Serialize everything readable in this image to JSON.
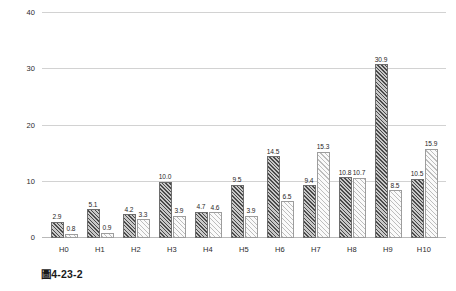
{
  "chart_data": {
    "type": "bar",
    "title": "",
    "xlabel": "",
    "ylabel": "",
    "ylim": [
      0,
      40
    ],
    "yticks": [
      0,
      10,
      20,
      30,
      40
    ],
    "ytick_labels": [
      "0",
      "10",
      "20",
      "30",
      "40"
    ],
    "grid": true,
    "legend": "none",
    "categories": [
      "H0",
      "H1",
      "H2",
      "H3",
      "H4",
      "H5",
      "H6",
      "H7",
      "H8",
      "H9",
      "H10"
    ],
    "series": [
      {
        "name": "series-a",
        "style": "dark-hatched",
        "values": [
          2.9,
          5.1,
          4.2,
          10.0,
          4.7,
          9.5,
          14.5,
          9.4,
          10.8,
          30.9,
          10.5
        ],
        "labels": [
          "2.9",
          "5.1",
          "4.2",
          "10.0",
          "4.7",
          "9.5",
          "14.5",
          "9.4",
          "10.8",
          "30.9",
          "10.5"
        ]
      },
      {
        "name": "series-b",
        "style": "light-hatched",
        "values": [
          0.8,
          0.9,
          3.3,
          3.9,
          4.6,
          3.9,
          6.5,
          15.3,
          10.7,
          8.5,
          15.9
        ],
        "labels": [
          "0.8",
          "0.9",
          "3.3",
          "3.9",
          "4.6",
          "3.9",
          "6.5",
          "15.3",
          "10.7",
          "8.5",
          "15.9"
        ]
      }
    ]
  },
  "caption": {
    "text": "圖4-23-2"
  },
  "colors": {
    "gridline": "#d2d2d2",
    "baseline": "#b9b9b9",
    "series_a_fill": "#8e8e8e",
    "series_a_hatch": "#4a4a4a",
    "series_b_fill": "#f3f3f3",
    "series_b_hatch": "#bdbdbd",
    "text": "#222222",
    "background": "#ffffff"
  }
}
